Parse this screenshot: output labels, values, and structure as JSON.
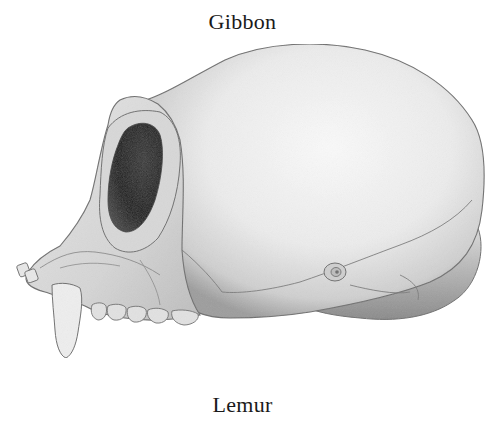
{
  "labels": {
    "top": "Gibbon",
    "bottom": "Lemur"
  },
  "illustration": {
    "subject": "primate-skull-lateral-view",
    "colors": {
      "bone_light": "#f2f2f2",
      "bone_mid": "#c9c9c9",
      "bone_shadow": "#7a7a7a",
      "outline": "#6e6e6e",
      "orbit_dark": "#1e1e1e"
    }
  }
}
